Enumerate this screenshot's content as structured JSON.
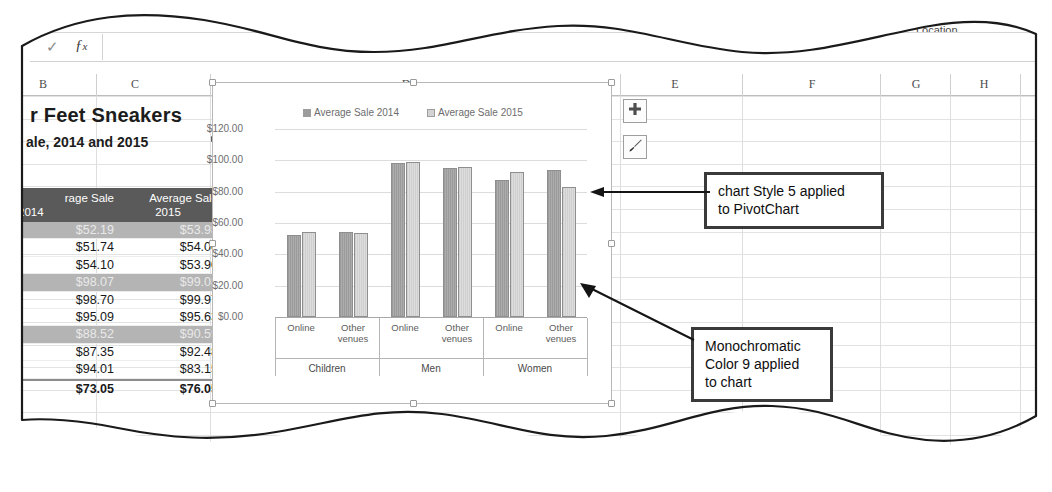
{
  "ribbon": {
    "labels": [
      {
        "text": "Chart Styles",
        "x": 322,
        "y": 9
      },
      {
        "text": "Data",
        "x": 762,
        "y": 12
      },
      {
        "text": "Type",
        "x": 845,
        "y": 12
      },
      {
        "text": "Location",
        "x": 898,
        "y": 12
      }
    ]
  },
  "formula_bar": {
    "check_icon": "check-icon",
    "fx_icon": "fx-icon",
    "value": "",
    "placeholder": ""
  },
  "columns": [
    {
      "label": "B",
      "center": 25,
      "right": 78
    },
    {
      "label": "C",
      "center": 117,
      "right": 192
    },
    {
      "label": "D",
      "center": 388,
      "right": 602
    },
    {
      "label": "E",
      "center": 657,
      "right": 724
    },
    {
      "label": "F",
      "center": 794,
      "right": 862
    },
    {
      "label": "G",
      "center": 898,
      "right": 932
    },
    {
      "label": "H",
      "center": 966,
      "right": 1002
    }
  ],
  "worksheet": {
    "title_line1": "r Feet Sneakers",
    "title_line2": "ale, 2014 and 2015",
    "move_cursor_icon": "move-cursor-icon"
  },
  "table": {
    "headers": [
      "rage Sale\n2014",
      "Average Sale\n2015"
    ],
    "header_2014": "rage Sale",
    "header_2014_year": "2014",
    "header_2015": "Average Sale",
    "header_2015_year": "2015",
    "rows": [
      {
        "v2014": "$52.19",
        "v2015": "$53.98",
        "highlight": true,
        "total": false
      },
      {
        "v2014": "$51.74",
        "v2015": "$54.00",
        "highlight": false,
        "total": false
      },
      {
        "v2014": "$54.10",
        "v2015": "$53.90",
        "highlight": false,
        "total": false
      },
      {
        "v2014": "$98.07",
        "v2015": "$99.08",
        "highlight": true,
        "total": false
      },
      {
        "v2014": "$98.70",
        "v2015": "$99.97",
        "highlight": false,
        "total": false
      },
      {
        "v2014": "$95.09",
        "v2015": "$95.63",
        "highlight": false,
        "total": false
      },
      {
        "v2014": "$88.52",
        "v2015": "$90.59",
        "highlight": true,
        "total": false
      },
      {
        "v2014": "$87.35",
        "v2015": "$92.48",
        "highlight": false,
        "total": false
      },
      {
        "v2014": "$94.01",
        "v2015": "$83.15",
        "highlight": false,
        "total": false
      },
      {
        "v2014": "$73.05",
        "v2015": "$76.05",
        "highlight": false,
        "total": true
      }
    ]
  },
  "chart_buttons": [
    {
      "name": "chart-elements-button",
      "icon": "plus-icon"
    },
    {
      "name": "chart-styles-button",
      "icon": "paintbrush-icon"
    }
  ],
  "callouts": [
    {
      "name": "callout-chart-style",
      "text": "chart Style 5 applied to PivotChart",
      "line1": "chart Style 5 applied",
      "line2": "to PivotChart"
    },
    {
      "name": "callout-monochromatic",
      "text": "Monochromatic Color 9 applied to chart",
      "line1": "Monochromatic",
      "line2": "Color 9 applied",
      "line3": "to chart"
    }
  ],
  "colors": {
    "series_2014": "#9c9c9c",
    "series_2015": "#d3d3d3",
    "table_header_bg": "#5a5a5a",
    "table_highlight_bg": "#b4b4b4",
    "callout_border": "#3a3a3a"
  },
  "chart_data": {
    "type": "bar",
    "title": "",
    "xlabel": "",
    "ylabel": "",
    "ylim": [
      0,
      120
    ],
    "ytick_labels": [
      "$120.00",
      "$100.00",
      "$80.00",
      "$60.00",
      "$40.00",
      "$20.00",
      "$0.00"
    ],
    "ytick_values": [
      120,
      100,
      80,
      60,
      40,
      20,
      0
    ],
    "grid": true,
    "legend": [
      "Average Sale 2014",
      "Average Sale 2015"
    ],
    "legend_position": "top",
    "groups": [
      "Children",
      "Men",
      "Women"
    ],
    "categories": [
      "Online",
      "Other venues",
      "Online",
      "Other venues",
      "Online",
      "Other venues"
    ],
    "series": [
      {
        "name": "Average Sale 2014",
        "values": [
          52.19,
          54.1,
          98.07,
          95.09,
          87.35,
          94.01
        ]
      },
      {
        "name": "Average Sale 2015",
        "values": [
          53.98,
          53.9,
          99.08,
          95.63,
          92.48,
          83.15
        ]
      }
    ]
  }
}
